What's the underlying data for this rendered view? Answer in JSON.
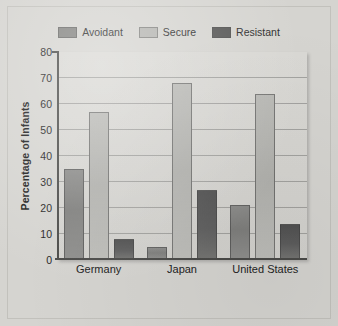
{
  "figure": {
    "background_color": "#d5d4d0",
    "plot_background_color": "#d6d5d1"
  },
  "chart_data": {
    "type": "bar",
    "title": "",
    "xlabel": "",
    "ylabel": "Percentage of Infants",
    "categories": [
      "Germany",
      "Japan",
      "United States"
    ],
    "series": [
      {
        "name": "Avoidant",
        "color": "#82827f",
        "values": [
          35,
          5,
          21
        ]
      },
      {
        "name": "Secure",
        "color": "#b4b4b0",
        "values": [
          57,
          68,
          64
        ]
      },
      {
        "name": "Resistant",
        "color": "#565655",
        "values": [
          8,
          27,
          14
        ]
      }
    ],
    "ylim": [
      0,
      80
    ],
    "yticks": [
      0,
      10,
      20,
      30,
      40,
      50,
      60,
      70,
      80
    ],
    "ytick_labels": [
      "0",
      "10",
      "20",
      "30",
      "40",
      "50",
      "60",
      "70",
      "80"
    ],
    "grid": true,
    "grid_axis": "y",
    "legend_position": "top-center"
  }
}
